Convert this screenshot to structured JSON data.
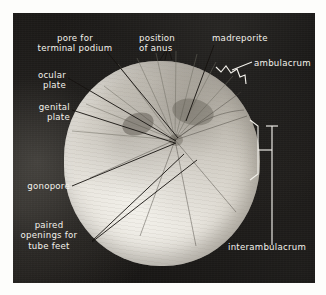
{
  "figure": {
    "kind": "labeled-photograph",
    "background_color": "#141210",
    "label_color": "#f4f2ec",
    "leader_color": "#15120f",
    "bracket_color": "#f2f0ea"
  },
  "labels": {
    "pore_terminal_podium": "pore for\nterminal podium",
    "position_of_anus": "position\nof anus",
    "madreporite": "madreporite",
    "ambulacrum": "ambulacrum",
    "ocular_plate": "ocular\nplate",
    "genital_plate": "genital\nplate",
    "gonopore": "gonopore",
    "paired_openings": "paired\nopenings for\ntube feet",
    "interambulacrum": "interambulacrum"
  }
}
